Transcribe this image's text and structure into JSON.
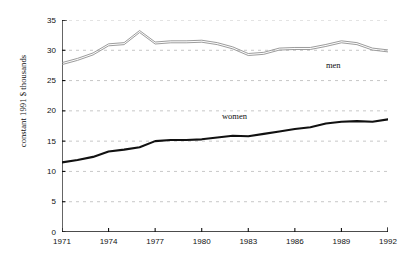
{
  "chart_data": {
    "type": "line",
    "title": "",
    "xlabel": "",
    "ylabel": "constant 1991 $ thousands",
    "xlim": [
      1971,
      1992
    ],
    "ylim": [
      0,
      35
    ],
    "ytick_labels": [
      "0",
      "5",
      "10",
      "15",
      "20",
      "25",
      "30",
      "35"
    ],
    "ytick_values": [
      0,
      5,
      10,
      15,
      20,
      25,
      30,
      35
    ],
    "xtick_labels": [
      "1971",
      "1974",
      "1977",
      "1980",
      "1983",
      "1986",
      "1989",
      "1992"
    ],
    "xtick_values": [
      1971,
      1974,
      1977,
      1980,
      1983,
      1986,
      1989,
      1992
    ],
    "grid": "horizontal-dashed",
    "legend_position": "inline-annotations",
    "x": [
      1971,
      1972,
      1973,
      1974,
      1975,
      1976,
      1977,
      1978,
      1979,
      1980,
      1981,
      1982,
      1983,
      1984,
      1985,
      1986,
      1987,
      1988,
      1989,
      1990,
      1991,
      1992
    ],
    "series": [
      {
        "name": "men",
        "color": "#8a8a8a",
        "line_style": "double-thin",
        "values": [
          27.7,
          28.4,
          29.3,
          30.8,
          31.0,
          33.0,
          31.1,
          31.3,
          31.3,
          31.4,
          31.0,
          30.3,
          29.2,
          29.4,
          30.1,
          30.2,
          30.2,
          30.7,
          31.3,
          31.0,
          30.1,
          29.8
        ]
      },
      {
        "name": "women",
        "color": "#111111",
        "line_style": "thick-solid",
        "values": [
          11.5,
          11.9,
          12.4,
          13.3,
          13.6,
          14.0,
          15.0,
          15.2,
          15.2,
          15.3,
          15.6,
          15.9,
          15.8,
          16.2,
          16.6,
          17.0,
          17.3,
          17.9,
          18.2,
          18.3,
          18.2,
          18.6
        ]
      }
    ],
    "annotations": [
      {
        "text": "men",
        "x": 1988.0,
        "y": 27.6
      },
      {
        "text": "women",
        "x": 1981.3,
        "y": 19.2
      }
    ]
  },
  "axis": {
    "y_title": "constant 1991 $ thousands"
  }
}
